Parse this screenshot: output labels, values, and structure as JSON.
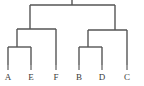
{
  "figure": {
    "type": "dendrogram",
    "title": "",
    "background_color": "#ffffff",
    "line_color": "#555555",
    "leaf_stem_color": "#6a6a6a",
    "label_color": "#3a3a3a",
    "width": 144,
    "height": 86
  },
  "chart_data": {
    "type": "dendrogram",
    "title": "",
    "xlabel": "",
    "ylabel": "",
    "orientation": "top-down",
    "grid": false,
    "legend": "none",
    "leaves": [
      {
        "label": "A",
        "x": 8,
        "order": 0
      },
      {
        "label": "E",
        "x": 31,
        "order": 1
      },
      {
        "label": "F",
        "x": 56,
        "order": 2
      },
      {
        "label": "B",
        "x": 79,
        "order": 3
      },
      {
        "label": "D",
        "x": 102,
        "order": 4
      },
      {
        "label": "C",
        "x": 127,
        "order": 5
      }
    ],
    "leaf_baseline_y": 65,
    "merges": [
      {
        "id": "m1",
        "members": [
          "A",
          "E"
        ],
        "left_x": 8,
        "right_x": 31,
        "center_x": 17,
        "y": 47
      },
      {
        "id": "m2",
        "members": [
          "B",
          "D"
        ],
        "left_x": 79,
        "right_x": 102,
        "center_x": 88,
        "y": 47
      },
      {
        "id": "m3",
        "members": [
          "A",
          "E",
          "F"
        ],
        "left_x": 17,
        "right_x": 56,
        "center_x": 30,
        "y": 29
      },
      {
        "id": "m4",
        "members": [
          "B",
          "D",
          "C"
        ],
        "left_x": 88,
        "right_x": 127,
        "center_x": 115,
        "y": 30
      },
      {
        "id": "m5",
        "members": [
          "A",
          "E",
          "F",
          "B",
          "D",
          "C"
        ],
        "left_x": 30,
        "right_x": 115,
        "center_x": 72,
        "y": 5
      }
    ],
    "root_stub": {
      "x": 72,
      "y_top": 0,
      "y_bottom": 5
    },
    "clusters": [
      {
        "name": "left-cluster",
        "leaves": [
          "A",
          "E",
          "F"
        ]
      },
      {
        "name": "right-cluster",
        "leaves": [
          "B",
          "D",
          "C"
        ]
      }
    ]
  }
}
